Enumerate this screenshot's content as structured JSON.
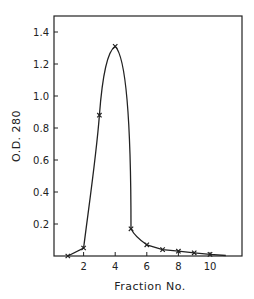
{
  "chart_data": {
    "type": "line",
    "title": "",
    "xlabel": "Fraction No.",
    "ylabel": "O.D. 280",
    "x": [
      1,
      2,
      3,
      4,
      5,
      6,
      7,
      8,
      9,
      10
    ],
    "series": [
      {
        "name": "O.D. 280",
        "marker": "x",
        "values": [
          0.0,
          0.05,
          0.88,
          1.31,
          0.17,
          0.07,
          0.04,
          0.03,
          0.02,
          0.01
        ]
      }
    ],
    "xticks": [
      "2",
      "4",
      "6",
      "8",
      "10"
    ],
    "yticks": [
      "0.2",
      "0.4",
      "0.6",
      "0.8",
      "1.0",
      "1.2",
      "1.4"
    ],
    "xlim": [
      0,
      12
    ],
    "ylim": [
      0,
      1.5
    ],
    "grid": false,
    "legend": "none"
  }
}
